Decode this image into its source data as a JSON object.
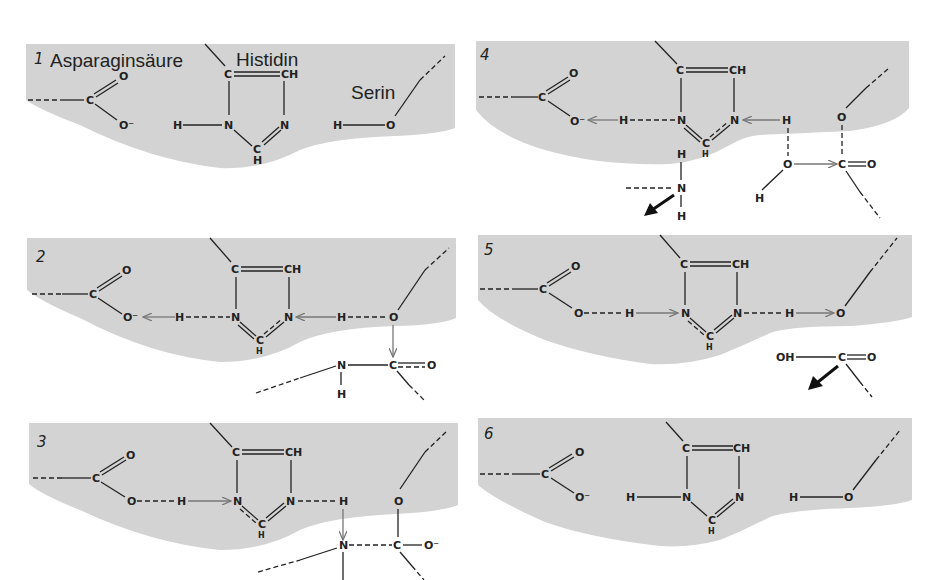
{
  "labels": {
    "aspartate": "Asparaginsäure",
    "histidine": "Histidin",
    "serine": "Serin"
  },
  "panels": [
    {
      "number": "1"
    },
    {
      "number": "2"
    },
    {
      "number": "3"
    },
    {
      "number": "4"
    },
    {
      "number": "5"
    },
    {
      "number": "6"
    }
  ],
  "atoms": {
    "C": "C",
    "O": "O",
    "O_minus": "O⁻",
    "N": "N",
    "H": "H",
    "CH": "CH",
    "OH": "OH"
  },
  "colors": {
    "background": "#ffffff",
    "enzyme_surface": "#d3d3d3",
    "bond": "#222222",
    "electron_arrow": "#777777",
    "leaving_arrow": "#111111"
  }
}
